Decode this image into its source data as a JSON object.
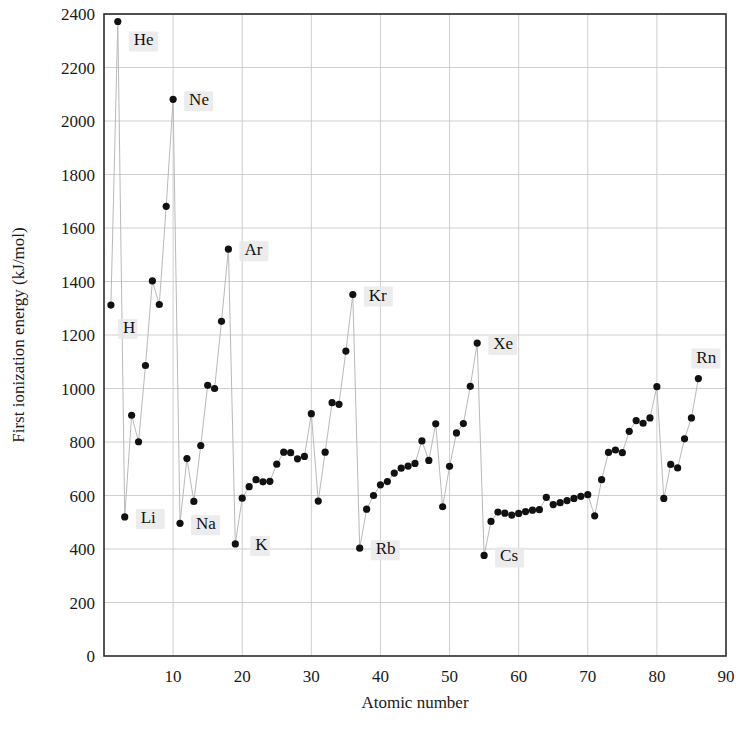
{
  "chart_data": {
    "type": "scatter",
    "title": "",
    "xlabel": "Atomic number",
    "ylabel": "First ionization energy (kJ/mol)",
    "xlim": [
      0,
      90
    ],
    "ylim": [
      0,
      2400
    ],
    "xticks": [
      10,
      20,
      30,
      40,
      50,
      60,
      70,
      80,
      90
    ],
    "yticks": [
      0,
      200,
      400,
      600,
      800,
      1000,
      1200,
      1400,
      1600,
      1800,
      2000,
      2200,
      2400
    ],
    "grid": true,
    "legend": "none",
    "connected": true,
    "marker": "filled-circle",
    "x": [
      1,
      2,
      3,
      4,
      5,
      6,
      7,
      8,
      9,
      10,
      11,
      12,
      13,
      14,
      15,
      16,
      17,
      18,
      19,
      20,
      21,
      22,
      23,
      24,
      25,
      26,
      27,
      28,
      29,
      30,
      31,
      32,
      33,
      34,
      35,
      36,
      37,
      38,
      39,
      40,
      41,
      42,
      43,
      44,
      45,
      46,
      47,
      48,
      49,
      50,
      51,
      52,
      53,
      54,
      55,
      56,
      57,
      58,
      59,
      60,
      61,
      62,
      63,
      64,
      65,
      66,
      67,
      68,
      69,
      70,
      71,
      72,
      73,
      74,
      75,
      76,
      77,
      78,
      79,
      80,
      81,
      82,
      83,
      84,
      85,
      86
    ],
    "values": [
      1312,
      2372,
      520,
      900,
      801,
      1086,
      1402,
      1314,
      1681,
      2081,
      496,
      738,
      578,
      787,
      1012,
      1000,
      1251,
      1521,
      419,
      590,
      633,
      659,
      651,
      653,
      717,
      762,
      760,
      737,
      746,
      906,
      579,
      762,
      947,
      941,
      1140,
      1351,
      403,
      549,
      600,
      640,
      652,
      684,
      702,
      710,
      720,
      804,
      731,
      868,
      558,
      709,
      834,
      869,
      1008,
      1170,
      376,
      503,
      538,
      534,
      527,
      533,
      540,
      545,
      547,
      593,
      566,
      573,
      581,
      589,
      597,
      603,
      524,
      659,
      761,
      770,
      760,
      840,
      880,
      870,
      890,
      1007,
      589,
      716,
      703,
      812,
      890,
      1037
    ],
    "annotations": [
      {
        "text": "H",
        "x": 1,
        "y": 1312,
        "dx": 12,
        "dy": 28
      },
      {
        "text": "He",
        "x": 2,
        "y": 2372,
        "dx": 16,
        "dy": 24
      },
      {
        "text": "Li",
        "x": 3,
        "y": 520,
        "dx": 16,
        "dy": 6
      },
      {
        "text": "Na",
        "x": 11,
        "y": 496,
        "dx": 16,
        "dy": 6
      },
      {
        "text": "Ne",
        "x": 10,
        "y": 2081,
        "dx": 16,
        "dy": 6
      },
      {
        "text": "Ar",
        "x": 18,
        "y": 1521,
        "dx": 16,
        "dy": 6
      },
      {
        "text": "K",
        "x": 19,
        "y": 419,
        "dx": 20,
        "dy": 6
      },
      {
        "text": "Kr",
        "x": 36,
        "y": 1351,
        "dx": 16,
        "dy": 6
      },
      {
        "text": "Rb",
        "x": 37,
        "y": 403,
        "dx": 16,
        "dy": 6
      },
      {
        "text": "Xe",
        "x": 54,
        "y": 1170,
        "dx": 16,
        "dy": 6
      },
      {
        "text": "Cs",
        "x": 55,
        "y": 376,
        "dx": 16,
        "dy": 6
      },
      {
        "text": "Rn",
        "x": 86,
        "y": 1037,
        "dx": -2,
        "dy": -16
      }
    ],
    "colors": {
      "marker": "#111111",
      "line": "#b9b9b9",
      "grid": "#c9c9c9",
      "frame": "#2b2b2b",
      "label_halo": "#e9e9e9"
    }
  }
}
